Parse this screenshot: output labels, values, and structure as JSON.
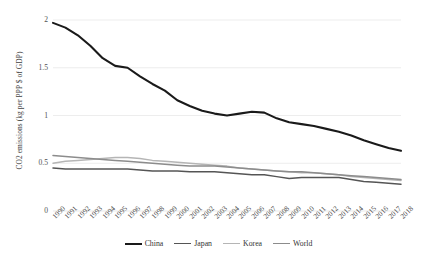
{
  "chart_data": {
    "type": "line",
    "title": "",
    "xlabel": "",
    "ylabel": "CO2 emissions (kg per PPP $ of GDP)",
    "ylim": [
      0,
      2
    ],
    "y_ticks": [
      "0",
      "0.5",
      "1",
      "1.5",
      "2"
    ],
    "grid": "horizontal",
    "legend_position": "bottom",
    "x": [
      "1990",
      "1991",
      "1992",
      "1993",
      "1994",
      "1995",
      "1996",
      "1997",
      "1998",
      "1999",
      "2000",
      "2001",
      "2002",
      "2003",
      "2004",
      "2005",
      "2006",
      "2007",
      "2008",
      "2009",
      "2010",
      "2011",
      "2012",
      "2013",
      "2014",
      "2015",
      "2016",
      "2017",
      "2018"
    ],
    "series": [
      {
        "name": "China",
        "color": "#1a1a1a",
        "width": 2.1,
        "values": [
          1.97,
          1.92,
          1.84,
          1.73,
          1.6,
          1.52,
          1.5,
          1.41,
          1.33,
          1.26,
          1.16,
          1.1,
          1.05,
          1.02,
          1.0,
          1.02,
          1.04,
          1.03,
          0.97,
          0.93,
          0.91,
          0.89,
          0.86,
          0.83,
          0.79,
          0.74,
          0.7,
          0.66,
          0.63
        ]
      },
      {
        "name": "Japan",
        "color": "#555555",
        "width": 1.5,
        "values": [
          0.45,
          0.44,
          0.44,
          0.44,
          0.44,
          0.44,
          0.44,
          0.43,
          0.42,
          0.42,
          0.42,
          0.41,
          0.41,
          0.41,
          0.4,
          0.39,
          0.38,
          0.38,
          0.36,
          0.34,
          0.35,
          0.35,
          0.35,
          0.35,
          0.33,
          0.31,
          0.3,
          0.29,
          0.28
        ]
      },
      {
        "name": "Korea",
        "color": "#b5b5b5",
        "width": 1.5,
        "values": [
          0.5,
          0.52,
          0.53,
          0.54,
          0.55,
          0.56,
          0.56,
          0.55,
          0.53,
          0.52,
          0.51,
          0.5,
          0.49,
          0.48,
          0.47,
          0.45,
          0.44,
          0.43,
          0.42,
          0.41,
          0.4,
          0.4,
          0.39,
          0.38,
          0.36,
          0.35,
          0.34,
          0.33,
          0.32
        ]
      },
      {
        "name": "World",
        "color": "#8c8c8c",
        "width": 1.5,
        "values": [
          0.58,
          0.57,
          0.56,
          0.55,
          0.54,
          0.53,
          0.52,
          0.51,
          0.5,
          0.49,
          0.48,
          0.47,
          0.47,
          0.47,
          0.46,
          0.45,
          0.44,
          0.43,
          0.42,
          0.41,
          0.41,
          0.4,
          0.39,
          0.38,
          0.37,
          0.36,
          0.35,
          0.34,
          0.33
        ]
      }
    ]
  },
  "legend": {
    "items": [
      {
        "label": "China",
        "color": "#1a1a1a",
        "width": 2.1
      },
      {
        "label": "Japan",
        "color": "#555555",
        "width": 1.7
      },
      {
        "label": "Korea",
        "color": "#b5b5b5",
        "width": 1.4
      },
      {
        "label": "World",
        "color": "#8c8c8c",
        "width": 1.6
      }
    ]
  },
  "style": {
    "grid_color": "#e9e9e9",
    "background": "#ffffff"
  }
}
